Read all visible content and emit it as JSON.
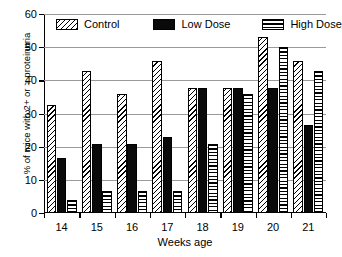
{
  "chart_data": {
    "type": "bar",
    "title": "",
    "xlabel": "Weeks age",
    "ylabel": "% of mice with 2+ or > proteinuria",
    "categories": [
      "14",
      "15",
      "16",
      "17",
      "18",
      "19",
      "20",
      "21"
    ],
    "series": [
      {
        "name": "Control",
        "pattern": "diagonal-hatch",
        "values": [
          32.5,
          42.7,
          35.8,
          45.7,
          37.7,
          37.7,
          53.0,
          45.7
        ]
      },
      {
        "name": "Low Dose",
        "pattern": "solid-black",
        "values": [
          16.6,
          20.7,
          20.7,
          22.8,
          37.7,
          37.7,
          37.7,
          26.6
        ]
      },
      {
        "name": "High Dose",
        "pattern": "horizontal-lines",
        "values": [
          3.8,
          6.7,
          6.7,
          6.7,
          20.7,
          35.8,
          50.0,
          42.7
        ]
      }
    ],
    "ylim": [
      0,
      60
    ],
    "yticks": [
      0,
      10,
      20,
      30,
      40,
      50,
      60
    ],
    "ytick_labels": [
      "0",
      "10",
      "20",
      "30",
      "40",
      "50",
      "60"
    ],
    "grid": true,
    "grid_axis": "y",
    "legend_position": "top-inside",
    "colors": {
      "control": "#ffffff",
      "low_dose": "#0a0a0a",
      "high_dose": "#ffffff",
      "axis": "#000000",
      "gridline": "#9a9a9a",
      "background": "#ffffff"
    }
  }
}
